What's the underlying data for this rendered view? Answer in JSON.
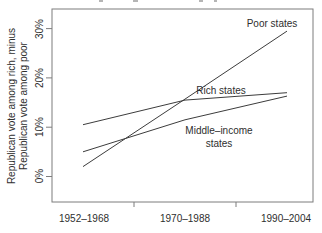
{
  "chart_data": {
    "type": "line",
    "categories": [
      "1952–1968",
      "1970–1988",
      "1990–2004"
    ],
    "series": [
      {
        "name": "Poor states",
        "values": [
          2,
          15.7,
          29.5
        ]
      },
      {
        "name": "Rich states",
        "values": [
          10.5,
          15.5,
          17
        ]
      },
      {
        "name": "Middle-income states",
        "values": [
          5,
          11.5,
          16.3
        ]
      }
    ],
    "ylabel_line1": "Republican vote among rich, minus",
    "ylabel_line2": "Republican vote among poor",
    "y_tick_labels": [
      "0%",
      "10%",
      "20%",
      "30%"
    ],
    "y_tick_values": [
      0,
      10,
      20,
      30
    ],
    "ylim": [
      -5,
      34
    ],
    "grid": false,
    "legend": "inline-labels",
    "line_color": "#3c3c3c",
    "frame_color": "#7d7d7d"
  },
  "annotations": {
    "poor_label": "Poor states",
    "rich_label": "Rich states",
    "middle_label_line1": "Middle–income",
    "middle_label_line2": "states"
  }
}
